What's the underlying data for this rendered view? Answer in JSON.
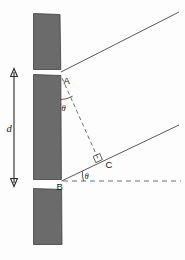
{
  "figure": {
    "background_color": "#fdfdfd",
    "slab_fill": "#6b6b6b",
    "slab_stroke": "#3f3f3f",
    "line_color": "#58585c",
    "dash_color": "#6e6e72",
    "label_color": "#151515"
  },
  "labels": {
    "point_a": "A",
    "point_b": "B",
    "point_c": "C",
    "separation": "d",
    "angle_top": "θ",
    "angle_bottom": "θ"
  },
  "elements": {
    "slabs": [
      {
        "name": "top-slab",
        "x": 33,
        "y": 13,
        "w": 27,
        "h": 57
      },
      {
        "name": "middle-slab",
        "x": 33,
        "y": 74,
        "w": 27,
        "h": 106
      },
      {
        "name": "bottom-slab",
        "x": 33,
        "y": 188,
        "w": 28,
        "h": 57
      }
    ],
    "rays": [
      {
        "name": "upper-ray",
        "x1": 61,
        "y1": 72,
        "x2": 179,
        "y2": 12
      },
      {
        "name": "lower-ray",
        "x1": 61,
        "y1": 181,
        "x2": 179,
        "y2": 125
      }
    ],
    "dashed_hypotenuse": {
      "name": "segment-ac",
      "x1": 62,
      "y1": 77,
      "x2": 99,
      "y2": 160
    },
    "dashed_baseline": {
      "name": "baseline-from-b",
      "x1": 62,
      "y1": 181,
      "x2": 181,
      "y2": 181
    },
    "dimension": {
      "name": "separation-d",
      "x": 14,
      "y1": 70,
      "y2": 185
    },
    "right_angle": {
      "name": "right-angle-at-c",
      "x": 94,
      "y": 154
    }
  }
}
